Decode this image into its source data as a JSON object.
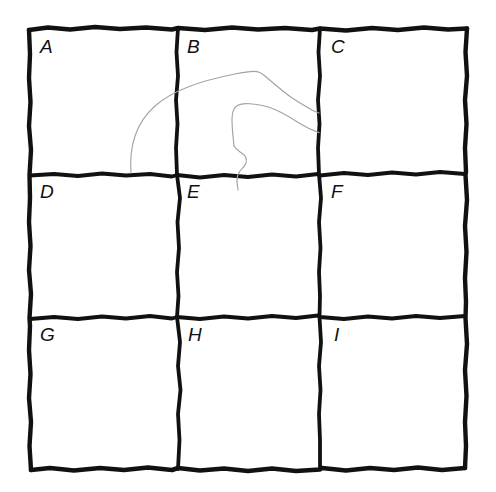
{
  "figure": {
    "type": "hand-drawn-sketch",
    "width": 496,
    "height": 492,
    "background_color": "#ffffff"
  },
  "grid": {
    "rows": 3,
    "columns": 3,
    "line_color": "#111111",
    "line_style": "hand-drawn-ink",
    "outer_border_width": 4.5,
    "inner_divider_width": 3.6,
    "cells": [
      {
        "id": "cell-a",
        "label": "A",
        "row": 0,
        "column": 0,
        "label_x": 40,
        "label_y": 44
      },
      {
        "id": "cell-b",
        "label": "B",
        "row": 0,
        "column": 1,
        "label_x": 187,
        "label_y": 44
      },
      {
        "id": "cell-c",
        "label": "C",
        "row": 0,
        "column": 2,
        "label_x": 331,
        "label_y": 44
      },
      {
        "id": "cell-d",
        "label": "D",
        "row": 1,
        "column": 0,
        "label_x": 40,
        "label_y": 189
      },
      {
        "id": "cell-e",
        "label": "E",
        "row": 1,
        "column": 1,
        "label_x": 187,
        "label_y": 189
      },
      {
        "id": "cell-f",
        "label": "F",
        "row": 1,
        "column": 2,
        "label_x": 331,
        "label_y": 189
      },
      {
        "id": "cell-g",
        "label": "G",
        "row": 2,
        "column": 0,
        "label_x": 40,
        "label_y": 331
      },
      {
        "id": "cell-h",
        "label": "H",
        "row": 2,
        "column": 1,
        "label_x": 188,
        "label_y": 331
      },
      {
        "id": "cell-i",
        "label": "I",
        "row": 2,
        "column": 2,
        "label_x": 334,
        "label_y": 331
      }
    ],
    "geometry": {
      "top_y": 28,
      "bottom_y": 468,
      "left_x": 29,
      "right_x": 467,
      "horizontal_divider_y": [
        175,
        318
      ],
      "vertical_divider_x": [
        177,
        320
      ]
    }
  },
  "curves": {
    "color": "#a3a3a3",
    "stroke_width": 1.1,
    "count": 2,
    "items": [
      {
        "id": "outer-contour",
        "name": "outer-contour-curve",
        "spans_cells": [
          "A",
          "B",
          "C"
        ],
        "description": "Long arc rising from lower cell A, crossing into B, peaking near the top of B, then falling to the right and ending at the B/C divider."
      },
      {
        "id": "inner-contour",
        "name": "inner-contour-curve",
        "spans_cells": [
          "B",
          "C",
          "E"
        ],
        "description": "Shorter nested arc inside B with a rounded top-left corner, a descending S-shaped tail dropping past the B/E divider, and a right branch ending at the B/C divider."
      }
    ]
  }
}
